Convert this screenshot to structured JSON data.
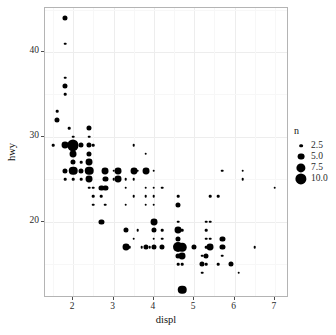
{
  "axes": {
    "x_title": "displ",
    "y_title": "hwy",
    "x_ticks": [
      "2",
      "3",
      "4",
      "5",
      "6",
      "7"
    ],
    "y_ticks": [
      "20",
      "30",
      "40"
    ]
  },
  "legend": {
    "title": "n",
    "entries": [
      {
        "label": "2.5",
        "size": 2.5
      },
      {
        "label": "5.0",
        "size": 5.0
      },
      {
        "label": "7.5",
        "size": 7.5
      },
      {
        "label": "10.0",
        "size": 10.0
      }
    ]
  },
  "chart_data": {
    "type": "scatter",
    "title": "",
    "xlabel": "displ",
    "ylabel": "hwy",
    "xlim": [
      1.3,
      7.35
    ],
    "ylim": [
      11.0,
      45.2
    ],
    "grid": true,
    "legend_position": "right",
    "size_legend": {
      "name": "n",
      "breaks": [
        2.5,
        5.0,
        7.5,
        10.0
      ]
    },
    "point_color": "#000000",
    "size_range_px": [
      1.3,
      5.6
    ],
    "series": [
      {
        "name": "count",
        "fields": [
          "displ",
          "hwy",
          "n"
        ],
        "points": [
          [
            1.8,
            44,
            2
          ],
          [
            1.8,
            41,
            1
          ],
          [
            1.8,
            37,
            1
          ],
          [
            1.8,
            36,
            2
          ],
          [
            1.8,
            35,
            1
          ],
          [
            1.6,
            33,
            1
          ],
          [
            1.6,
            32,
            2
          ],
          [
            1.9,
            31,
            1
          ],
          [
            2.4,
            31,
            2
          ],
          [
            2.0,
            30,
            1
          ],
          [
            2.4,
            30,
            1
          ],
          [
            1.5,
            29,
            1
          ],
          [
            1.8,
            29,
            3
          ],
          [
            2.0,
            29,
            6
          ],
          [
            2.2,
            29,
            2
          ],
          [
            2.4,
            29,
            2
          ],
          [
            2.0,
            28,
            3
          ],
          [
            2.4,
            28,
            2
          ],
          [
            2.0,
            27,
            2
          ],
          [
            2.2,
            27,
            1
          ],
          [
            2.4,
            27,
            3
          ],
          [
            1.8,
            26,
            2
          ],
          [
            2.0,
            26,
            4
          ],
          [
            2.2,
            26,
            2
          ],
          [
            2.4,
            26,
            4
          ],
          [
            2.8,
            26,
            3
          ],
          [
            3.0,
            26,
            1
          ],
          [
            3.1,
            26,
            3
          ],
          [
            3.5,
            26,
            3
          ],
          [
            3.8,
            26,
            3
          ],
          [
            4.0,
            26,
            1
          ],
          [
            1.8,
            25,
            1
          ],
          [
            2.4,
            25,
            3
          ],
          [
            2.8,
            25,
            2
          ],
          [
            3.1,
            25,
            3
          ],
          [
            3.3,
            25,
            1
          ],
          [
            3.5,
            25,
            1
          ],
          [
            2.7,
            24,
            2
          ],
          [
            2.8,
            24,
            2
          ],
          [
            3.3,
            24,
            1
          ],
          [
            3.8,
            24,
            1
          ],
          [
            4.0,
            24,
            1
          ],
          [
            4.2,
            24,
            1
          ],
          [
            2.5,
            23,
            1
          ],
          [
            2.7,
            23,
            1
          ],
          [
            3.5,
            23,
            1
          ],
          [
            3.8,
            23,
            1
          ],
          [
            4.0,
            23,
            1
          ],
          [
            4.6,
            23,
            1
          ],
          [
            5.4,
            23,
            1
          ],
          [
            2.5,
            22,
            1
          ],
          [
            2.8,
            22,
            1
          ],
          [
            3.3,
            22,
            1
          ],
          [
            3.8,
            22,
            1
          ],
          [
            4.0,
            22,
            1
          ],
          [
            4.6,
            22,
            2
          ],
          [
            2.7,
            20,
            2
          ],
          [
            4.0,
            20,
            3
          ],
          [
            4.6,
            20,
            1
          ],
          [
            5.3,
            20,
            1
          ],
          [
            5.4,
            20,
            1
          ],
          [
            3.3,
            19,
            2
          ],
          [
            3.6,
            19,
            1
          ],
          [
            4.0,
            19,
            2
          ],
          [
            4.2,
            19,
            1
          ],
          [
            4.6,
            19,
            3
          ],
          [
            4.7,
            19,
            1
          ],
          [
            5.3,
            19,
            1
          ],
          [
            3.5,
            18,
            1
          ],
          [
            4.0,
            18,
            1
          ],
          [
            4.2,
            18,
            1
          ],
          [
            4.6,
            18,
            2
          ],
          [
            5.3,
            18,
            1
          ],
          [
            5.4,
            18,
            1
          ],
          [
            5.7,
            18,
            2
          ],
          [
            3.3,
            17,
            3
          ],
          [
            3.4,
            17,
            1
          ],
          [
            3.7,
            17,
            1
          ],
          [
            3.8,
            17,
            2
          ],
          [
            3.9,
            17,
            1
          ],
          [
            4.0,
            17,
            2
          ],
          [
            4.2,
            17,
            2
          ],
          [
            4.6,
            17,
            5
          ],
          [
            4.7,
            17,
            4
          ],
          [
            5.0,
            17,
            2
          ],
          [
            5.3,
            17,
            1
          ],
          [
            5.4,
            17,
            3
          ],
          [
            5.7,
            17,
            2
          ],
          [
            6.5,
            17,
            1
          ],
          [
            4.6,
            16,
            2
          ],
          [
            4.7,
            16,
            3
          ],
          [
            5.2,
            16,
            1
          ],
          [
            5.3,
            16,
            2
          ],
          [
            5.7,
            16,
            1
          ],
          [
            4.6,
            15,
            1
          ],
          [
            4.7,
            15,
            1
          ],
          [
            5.2,
            15,
            2
          ],
          [
            5.3,
            15,
            1
          ],
          [
            5.6,
            15,
            1
          ],
          [
            5.9,
            15,
            2
          ],
          [
            5.2,
            14,
            1
          ],
          [
            6.1,
            14,
            1
          ],
          [
            4.7,
            12,
            4
          ],
          [
            5.7,
            26,
            1
          ],
          [
            6.2,
            26,
            1
          ],
          [
            6.2,
            25,
            1
          ],
          [
            7.0,
            24,
            1
          ],
          [
            5.6,
            23,
            1
          ],
          [
            2.5,
            24,
            1
          ],
          [
            3.0,
            25,
            1
          ],
          [
            2.0,
            25,
            1
          ],
          [
            2.2,
            25,
            1
          ],
          [
            2.5,
            29,
            1
          ],
          [
            2.4,
            24,
            1
          ],
          [
            3.6,
            26,
            1
          ],
          [
            3.5,
            29,
            1
          ],
          [
            3.8,
            28,
            1
          ]
        ]
      }
    ]
  }
}
